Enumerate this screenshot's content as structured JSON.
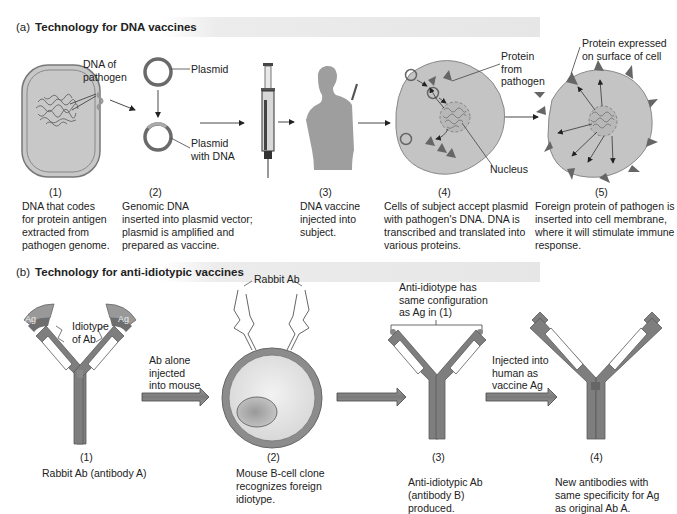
{
  "section_a": {
    "letter": "(a)",
    "title": "Technology for DNA vaccines",
    "labels": {
      "dna_of_pathogen": [
        "DNA of",
        "pathogen"
      ],
      "plasmid": "Plasmid",
      "plasmid_with_dna": [
        "Plasmid",
        "with DNA"
      ],
      "protein_from_pathogen": [
        "Protein",
        "from",
        "pathogen"
      ],
      "nucleus": "Nucleus",
      "protein_expressed": [
        "Protein expressed",
        "on surface of cell"
      ]
    },
    "steps": [
      {
        "number": "(1)",
        "caption": [
          "DNA that codes",
          "for protein antigen",
          "extracted from",
          "pathogen genome."
        ]
      },
      {
        "number": "(2)",
        "caption": [
          "Genomic DNA",
          "inserted into plasmid vector;",
          "plasmid is amplified and",
          "prepared as vaccine."
        ]
      },
      {
        "number": "(3)",
        "caption": [
          "DNA vaccine",
          "injected into",
          "subject."
        ]
      },
      {
        "number": "(4)",
        "caption": [
          "Cells of subject accept plasmid",
          "with pathogen's DNA. DNA is",
          "transcribed and translated into",
          "various proteins."
        ]
      },
      {
        "number": "(5)",
        "caption": [
          "Foreign protein of pathogen is",
          "inserted into cell membrane,",
          "where it will stimulate immune",
          "response."
        ]
      }
    ]
  },
  "section_b": {
    "letter": "(b)",
    "title": "Technology for anti-idiotypic vaccines",
    "labels": {
      "ag_left": "Ag",
      "ag_right": "Ag",
      "idiotype": [
        "Idiotype",
        "of Ab"
      ],
      "ab_alone": [
        "Ab alone",
        "injected",
        "into mouse"
      ],
      "rabbit_ab": "Rabbit Ab",
      "anti_idiotype": [
        "Anti-idiotype has",
        "same configuration",
        "as Ag in (1)"
      ],
      "injected_human": [
        "Injected into",
        "human as",
        "vaccine Ag"
      ]
    },
    "steps": [
      {
        "number": "(1)",
        "caption": [
          "Rabbit Ab (antibody A)"
        ]
      },
      {
        "number": "(2)",
        "caption": [
          "Mouse B-cell clone",
          "recognizes foreign",
          "idiotype."
        ]
      },
      {
        "number": "(3)",
        "caption": [
          "Anti-idiotypic Ab",
          "(antibody B)",
          "produced."
        ]
      },
      {
        "number": "(4)",
        "caption": [
          "New antibodies with",
          "same specificity for Ag",
          "as original Ab A."
        ]
      }
    ]
  },
  "colors": {
    "cell_fill": "#c4c4c4",
    "dark_gray": "#6e6e6e",
    "antibody": "#808080",
    "header_band": "#e8e8e8"
  }
}
